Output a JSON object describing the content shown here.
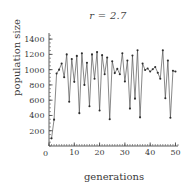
{
  "chart_data": {
    "type": "line",
    "title": "r = 2.7",
    "subtitle": "",
    "xlabel": "generations",
    "ylabel": "population size",
    "xlim": [
      0,
      51
    ],
    "ylim": [
      0,
      1480
    ],
    "grid": false,
    "legend": "none",
    "markers": "filled-dot",
    "line_color": "#555555",
    "marker_color": "#2e2e2e",
    "xticks": [
      0,
      10,
      20,
      30,
      40,
      50
    ],
    "xtick_labels": [
      "0",
      "10",
      "20",
      "30",
      "40",
      "50"
    ],
    "xticks_minor_step": 1,
    "yticks": [
      200,
      400,
      600,
      800,
      1000,
      1200,
      1400
    ],
    "ytick_labels": [
      "200",
      "400",
      "600",
      "800",
      "1000",
      "1200",
      "1400"
    ],
    "yticks_minor_step": 50,
    "x": [
      1,
      2,
      3,
      4,
      5,
      6,
      7,
      8,
      9,
      10,
      11,
      12,
      13,
      14,
      15,
      16,
      17,
      18,
      19,
      20,
      21,
      22,
      23,
      24,
      25,
      26,
      27,
      28,
      29,
      30,
      31,
      32,
      33,
      34,
      35,
      36,
      37,
      38,
      39,
      40,
      41,
      42,
      43,
      44,
      45,
      46,
      47,
      48,
      49,
      50
    ],
    "series": [
      {
        "name": "population size",
        "values": [
          100,
          345,
          950,
          1000,
          1080,
          900,
          1200,
          580,
          1140,
          840,
          1180,
          430,
          1215,
          800,
          1090,
          520,
          1200,
          880,
          1230,
          465,
          1190,
          940,
          1160,
          350,
          1110,
          955,
          1010,
          940,
          1215,
          845,
          1120,
          490,
          1185,
          620,
          1255,
          375,
          1080,
          995,
          1015,
          975,
          1005,
          1035,
          960,
          880,
          1255,
          625,
          1120,
          370,
          985,
          975
        ]
      }
    ]
  }
}
